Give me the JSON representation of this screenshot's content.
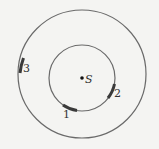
{
  "diagram": {
    "source_label": "S",
    "patches": [
      {
        "id": "1",
        "label": "1",
        "circle": "inner"
      },
      {
        "id": "2",
        "label": "2",
        "circle": "inner"
      },
      {
        "id": "3",
        "label": "3",
        "circle": "outer"
      }
    ],
    "colors": {
      "circle": "#6a6a6a",
      "patch": "#3a3a3a",
      "background": "#f4f4f2"
    }
  }
}
